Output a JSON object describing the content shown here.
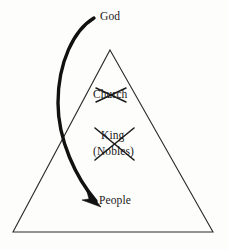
{
  "diagram": {
    "type": "hierarchy-pyramid-with-arrow",
    "title": "",
    "background_color": "#fdfdfc",
    "ink_color": "#1a1a1a",
    "triangle": {
      "name": "social-hierarchy-pyramid",
      "apex": {
        "x": 110,
        "y": 50
      },
      "base_left": {
        "x": 13,
        "y": 232
      },
      "base_right": {
        "x": 213,
        "y": 232
      },
      "stroke_color": "#2b2b2b",
      "stroke_width": 1
    },
    "labels": [
      {
        "id": "god",
        "text": "God",
        "struck_out": false,
        "position": {
          "x": 100,
          "y": 11
        }
      },
      {
        "id": "church",
        "text": "Church",
        "struck_out": true,
        "position": {
          "x": 93,
          "y": 89
        }
      },
      {
        "id": "king",
        "text": "King",
        "struck_out": true,
        "position": {
          "x": 101,
          "y": 130
        }
      },
      {
        "id": "nobles",
        "text": "(Nobles)",
        "struck_out": true,
        "position": {
          "x": 93,
          "y": 146
        }
      },
      {
        "id": "people",
        "text": "People",
        "struck_out": false,
        "position": {
          "x": 99,
          "y": 195
        }
      }
    ],
    "arrow": {
      "name": "god-to-people-arrow",
      "description": "thick curved arrow from God down to People",
      "start": {
        "x": 94,
        "y": 18
      },
      "end": {
        "x": 99,
        "y": 205
      },
      "bulge": {
        "x": 58,
        "y": 103
      },
      "color": "#111111",
      "arrowhead": "solid-triangle"
    },
    "cross_outs": [
      {
        "id": "church-x",
        "target": "church",
        "cx": 110,
        "cy": 95
      },
      {
        "id": "king-nobles-x",
        "target": "king-and-nobles",
        "cx": 114,
        "cy": 145
      }
    ]
  }
}
